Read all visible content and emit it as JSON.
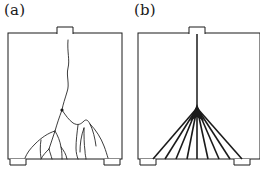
{
  "figure": {
    "background_color": "#ffffff",
    "line_color": "#1a1a1a",
    "panels": [
      {
        "id": "a",
        "label": "(a)",
        "caption_text": "(a)",
        "pattern_name": "branched-tree-discharge",
        "trunk_style": "irregular-wavy",
        "branch_count": 14,
        "ray_count": 0,
        "specimen_box": {
          "x": 8,
          "y": 33,
          "width": 114,
          "height": 126
        },
        "electrodes": {
          "top": {
            "x": 57,
            "y": 27,
            "width": 16,
            "height": 7
          },
          "bottom_left": {
            "x": 10,
            "y": 155,
            "width": 16,
            "height": 7
          },
          "bottom_right": {
            "x": 104,
            "y": 155,
            "width": 16,
            "height": 7
          }
        }
      },
      {
        "id": "b",
        "label": "(b)",
        "caption_text": "(b)",
        "pattern_name": "fan-bush-discharge",
        "trunk_style": "straight-vertical",
        "branch_count": 0,
        "ray_count": 9,
        "specimen_box": {
          "x": 8,
          "y": 33,
          "width": 114,
          "height": 126
        },
        "electrodes": {
          "top": {
            "x": 59,
            "y": 27,
            "width": 16,
            "height": 7
          },
          "bottom_left": {
            "x": 10,
            "y": 155,
            "width": 16,
            "height": 7
          },
          "bottom_right": {
            "x": 104,
            "y": 155,
            "width": 16,
            "height": 7
          }
        }
      }
    ]
  }
}
